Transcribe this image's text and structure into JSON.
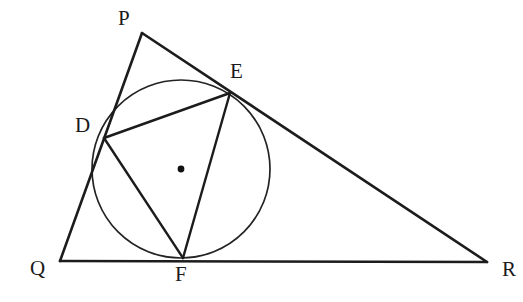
{
  "figure": {
    "canvas": {
      "width": 523,
      "height": 302,
      "background": "#ffffff"
    },
    "stroke_color": "#1c1c1c",
    "circle_color": "#232323",
    "label_color": "#1a1a1a"
  },
  "points": {
    "P": {
      "label": "P",
      "x": 142,
      "y": 33,
      "label_x": 118,
      "label_y": 8
    },
    "Q": {
      "label": "Q",
      "x": 60,
      "y": 261,
      "label_x": 30,
      "label_y": 258
    },
    "R": {
      "label": "R",
      "x": 487,
      "y": 262,
      "label_x": 502,
      "label_y": 259
    },
    "D": {
      "label": "D",
      "x": 104,
      "y": 138,
      "label_x": 75,
      "label_y": 115
    },
    "E": {
      "label": "E",
      "x": 230,
      "y": 93,
      "label_x": 230,
      "label_y": 61
    },
    "F": {
      "label": "F",
      "x": 183,
      "y": 258,
      "label_x": 175,
      "label_y": 264
    }
  },
  "circle": {
    "name": "incircle",
    "center_x": 181,
    "center_y": 169,
    "radius": 89,
    "center_dot_radius": 3.4
  },
  "segments": [
    {
      "name": "side-PQ",
      "from": "P",
      "to": "Q"
    },
    {
      "name": "side-PR",
      "from": "P",
      "to": "R"
    },
    {
      "name": "side-QR",
      "from": "Q",
      "to": "R"
    }
  ],
  "chords": [
    {
      "name": "chord-DE",
      "from": "D",
      "to": "E"
    },
    {
      "name": "chord-EF",
      "from": "E",
      "to": "F"
    },
    {
      "name": "chord-FD",
      "from": "F",
      "to": "D"
    }
  ]
}
